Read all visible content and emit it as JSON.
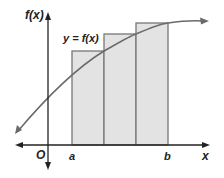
{
  "diagram": {
    "labels": {
      "y_axis": "f(x)",
      "x_axis": "x",
      "origin": "O",
      "curve": "y = f(x)",
      "left_endpoint": "a",
      "right_endpoint": "b"
    },
    "rectangles": {
      "count": 3,
      "fill": "#e3e3e3",
      "stroke": "#777777"
    },
    "colors": {
      "axes": "#222222",
      "curve": "#6a6a6a",
      "rect_fill": "#e3e3e3",
      "rect_stroke": "#777777"
    }
  }
}
